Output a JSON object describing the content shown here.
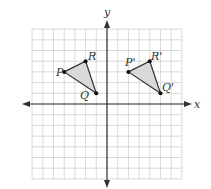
{
  "diagram": {
    "type": "coordinate-plane-translation",
    "axes": {
      "x_label": "x",
      "y_label": "y"
    },
    "grid": {
      "x_min": -7,
      "x_max": 7,
      "y_min": -7,
      "y_max": 7,
      "unit_px": 10.7
    },
    "colors": {
      "grid": "#cfcfcf",
      "axis": "#333333",
      "fill": "#d9d9d9",
      "stroke": "#333333"
    },
    "triangles": [
      {
        "name": "PQR",
        "points": [
          {
            "label": "P",
            "x": -4,
            "y": 3
          },
          {
            "label": "R",
            "x": -2,
            "y": 4
          },
          {
            "label": "Q",
            "x": -1,
            "y": 1
          }
        ]
      },
      {
        "name": "P'Q'R'",
        "points": [
          {
            "label": "P'",
            "x": 2,
            "y": 3
          },
          {
            "label": "R'",
            "x": 4,
            "y": 4
          },
          {
            "label": "Q'",
            "x": 5,
            "y": 1
          }
        ]
      }
    ]
  }
}
